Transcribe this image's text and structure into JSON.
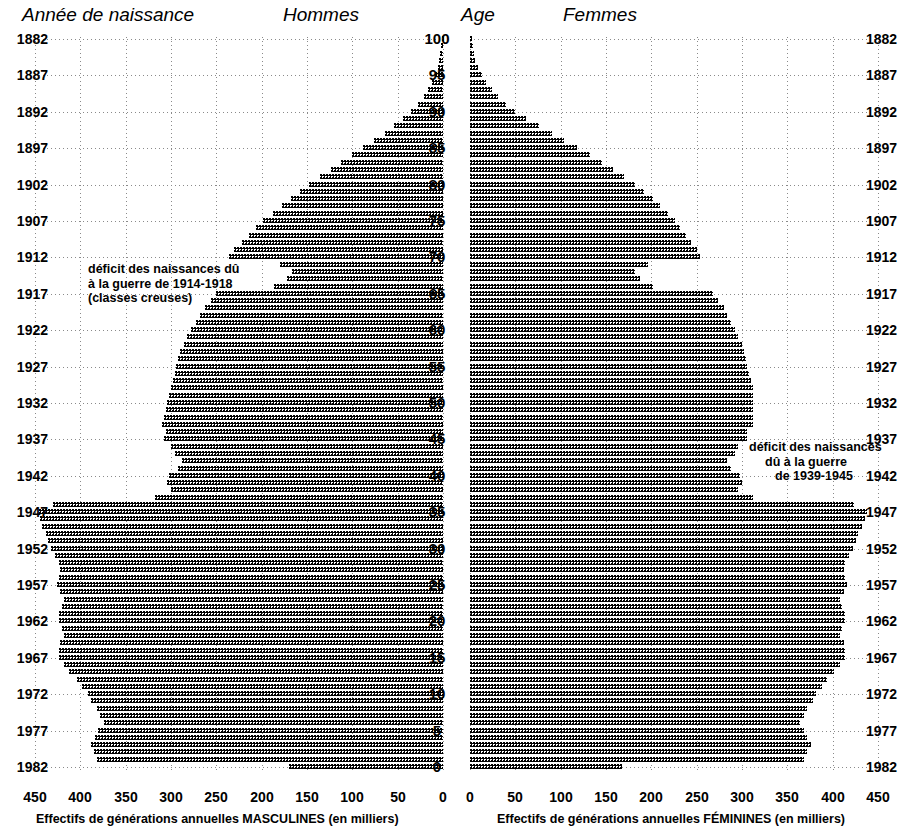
{
  "headers": {
    "birth_year": "Année de naissance",
    "men": "Hommes",
    "age": "Age",
    "women": "Femmes"
  },
  "annotations": {
    "ww1": {
      "line1": "déficit des naissances dû",
      "line2": "à la guerre de 1914-1918",
      "line3": "(classes creuses)"
    },
    "ww2": {
      "line1": "déficit des naissances",
      "line2": "dû à la guerre",
      "line3": "de 1939-1945"
    }
  },
  "axes": {
    "left_caption": "Effectifs de générations annuelles MASCULINES (en milliers)",
    "right_caption": "Effectifs de générations annuelles FÉMININES (en milliers)",
    "left_ticks": [
      "450",
      "400",
      "350",
      "300",
      "250",
      "200",
      "150",
      "100",
      "50",
      "0"
    ],
    "right_ticks": [
      "0",
      "50",
      "100",
      "150",
      "200",
      "250",
      "300",
      "350",
      "400",
      "450"
    ],
    "age_ticks": [
      "100",
      "95",
      "90",
      "85",
      "80",
      "75",
      "70",
      "65",
      "60",
      "55",
      "50",
      "45",
      "40",
      "35",
      "30",
      "25",
      "20",
      "15",
      "10",
      "5",
      "0"
    ],
    "year_ticks": [
      "1882",
      "1887",
      "1892",
      "1897",
      "1902",
      "1907",
      "1912",
      "1917",
      "1922",
      "1927",
      "1932",
      "1937",
      "1942",
      "1947",
      "1952",
      "1957",
      "1962",
      "1967",
      "1972",
      "1977",
      "1982"
    ]
  },
  "chart_data": {
    "type": "bar",
    "orientation": "horizontal-pyramid",
    "xlabel_left": "Effectifs de générations annuelles MASCULINES (en milliers)",
    "xlabel_right": "Effectifs de générations annuelles FÉMININES (en milliers)",
    "ylabel": "Age",
    "ylabel_secondary": "Année de naissance",
    "xlim": [
      0,
      450
    ],
    "ylim": [
      0,
      100
    ],
    "grid": true,
    "legend": "none",
    "units": "milliers",
    "ages": [
      0,
      1,
      2,
      3,
      4,
      5,
      6,
      7,
      8,
      9,
      10,
      11,
      12,
      13,
      14,
      15,
      16,
      17,
      18,
      19,
      20,
      21,
      22,
      23,
      24,
      25,
      26,
      27,
      28,
      29,
      30,
      31,
      32,
      33,
      34,
      35,
      36,
      37,
      38,
      39,
      40,
      41,
      42,
      43,
      44,
      45,
      46,
      47,
      48,
      49,
      50,
      51,
      52,
      53,
      54,
      55,
      56,
      57,
      58,
      59,
      60,
      61,
      62,
      63,
      64,
      65,
      66,
      67,
      68,
      69,
      70,
      71,
      72,
      73,
      74,
      75,
      76,
      77,
      78,
      79,
      80,
      81,
      82,
      83,
      84,
      85,
      86,
      87,
      88,
      89,
      90,
      91,
      92,
      93,
      94,
      95,
      96,
      97,
      98,
      99,
      100
    ],
    "birth_years": [
      1982,
      1981,
      1980,
      1979,
      1978,
      1977,
      1976,
      1975,
      1974,
      1973,
      1972,
      1971,
      1970,
      1969,
      1968,
      1967,
      1966,
      1965,
      1964,
      1963,
      1962,
      1961,
      1960,
      1959,
      1958,
      1957,
      1956,
      1955,
      1954,
      1953,
      1952,
      1951,
      1950,
      1949,
      1948,
      1947,
      1946,
      1945,
      1944,
      1943,
      1942,
      1941,
      1940,
      1939,
      1938,
      1937,
      1936,
      1935,
      1934,
      1933,
      1932,
      1931,
      1930,
      1929,
      1928,
      1927,
      1926,
      1925,
      1924,
      1923,
      1922,
      1921,
      1920,
      1919,
      1918,
      1917,
      1916,
      1915,
      1914,
      1913,
      1912,
      1911,
      1910,
      1909,
      1908,
      1907,
      1906,
      1905,
      1904,
      1903,
      1902,
      1901,
      1900,
      1899,
      1898,
      1897,
      1896,
      1895,
      1894,
      1893,
      1892,
      1891,
      1890,
      1889,
      1888,
      1887,
      1886,
      1885,
      1884,
      1883,
      1882
    ],
    "series": [
      {
        "name": "Hommes",
        "side": "left",
        "values": [
          170,
          382,
          385,
          388,
          384,
          380,
          374,
          378,
          382,
          388,
          392,
          398,
          404,
          412,
          418,
          424,
          424,
          422,
          418,
          420,
          424,
          424,
          420,
          418,
          422,
          426,
          424,
          422,
          424,
          428,
          432,
          436,
          438,
          442,
          444,
          446,
          430,
          318,
          300,
          304,
          302,
          292,
          288,
          296,
          300,
          308,
          306,
          310,
          308,
          306,
          304,
          302,
          300,
          298,
          296,
          294,
          292,
          290,
          286,
          282,
          278,
          272,
          268,
          262,
          256,
          250,
          186,
          172,
          166,
          180,
          236,
          230,
          222,
          214,
          206,
          198,
          188,
          178,
          168,
          158,
          148,
          136,
          124,
          112,
          100,
          88,
          76,
          64,
          54,
          44,
          35,
          28,
          21,
          16,
          12,
          9,
          6,
          4,
          3,
          2,
          1
        ]
      },
      {
        "name": "Femmes",
        "side": "right",
        "values": [
          168,
          368,
          372,
          376,
          372,
          368,
          364,
          368,
          372,
          378,
          382,
          388,
          394,
          402,
          408,
          414,
          414,
          412,
          408,
          410,
          414,
          414,
          410,
          408,
          412,
          416,
          414,
          412,
          414,
          418,
          422,
          426,
          428,
          432,
          436,
          438,
          424,
          312,
          296,
          300,
          298,
          288,
          284,
          292,
          296,
          306,
          306,
          312,
          312,
          312,
          312,
          312,
          312,
          310,
          308,
          306,
          304,
          302,
          300,
          296,
          292,
          288,
          284,
          280,
          274,
          268,
          202,
          188,
          182,
          196,
          254,
          250,
          244,
          238,
          232,
          226,
          218,
          210,
          202,
          192,
          182,
          170,
          158,
          146,
          132,
          118,
          104,
          90,
          76,
          62,
          50,
          40,
          31,
          24,
          18,
          13,
          9,
          6,
          4,
          3,
          2
        ]
      }
    ]
  }
}
